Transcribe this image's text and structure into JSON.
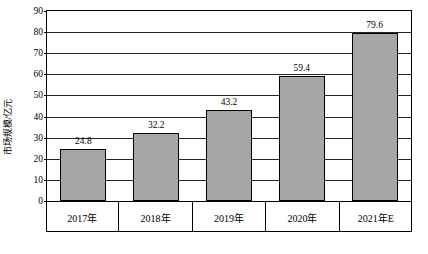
{
  "chart_data": {
    "type": "bar",
    "title": "",
    "xlabel": "",
    "ylabel": "市场规模/亿元",
    "categories": [
      "2017年",
      "2018年",
      "2019年",
      "2020年",
      "2021年E"
    ],
    "values": [
      24.8,
      32.2,
      43.2,
      59.4,
      79.6
    ],
    "value_labels": [
      "24.8",
      "32.2",
      "43.2",
      "59.4",
      "79.6"
    ],
    "ylim": [
      0,
      90
    ],
    "yticks": [
      0,
      10,
      20,
      30,
      40,
      50,
      60,
      70,
      80,
      90
    ],
    "ytick_labels": [
      "0",
      "10",
      "20",
      "30",
      "40",
      "50",
      "60",
      "70",
      "80",
      "90"
    ],
    "grid": true,
    "legend": null,
    "bar_color": "#a6a6a6",
    "bar_border_color": "#000000",
    "axis_color": "#000000"
  }
}
